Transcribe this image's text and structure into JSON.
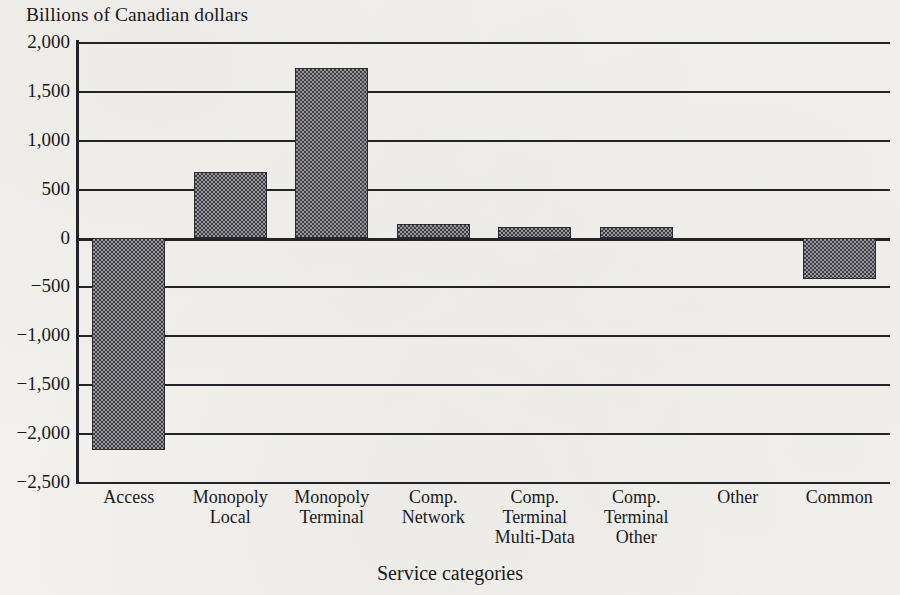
{
  "chart_data": {
    "type": "bar",
    "title": "Billions of Canadian dollars",
    "xlabel": "Service categories",
    "ylabel": "",
    "categories": [
      "Access",
      "Monopoly\nLocal",
      "Monopoly\nTerminal",
      "Comp.\nNetwork",
      "Comp.\nTerminal\nMulti-Data",
      "Comp.\nTerminal\nOther",
      "Other",
      "Common"
    ],
    "values": [
      -2170,
      670,
      1730,
      140,
      110,
      110,
      0,
      -420
    ],
    "ylim": [
      -2500,
      2000
    ],
    "ytick_values": [
      2000,
      1500,
      1000,
      500,
      0,
      -500,
      -1000,
      -1500,
      -2000,
      -2500
    ],
    "ytick_labels": [
      "2,000",
      "1,500",
      "1,000",
      "500",
      "0",
      "−500",
      "−1,000",
      "−1,500",
      "−2,000",
      "−2,500"
    ],
    "grid": true,
    "legend": null,
    "bar_fill": "#6d6d72",
    "bar_edge": "#2b2b30",
    "axis_color": "#23232a",
    "background": "#f2f1ee"
  }
}
